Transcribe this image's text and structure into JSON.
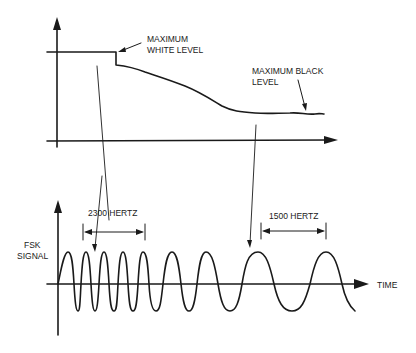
{
  "top_plot": {
    "label_white": [
      "MAXIMUM",
      "WHITE LEVEL"
    ],
    "label_black": [
      "MAXIMUM BLACK",
      "LEVEL"
    ]
  },
  "bottom_plot": {
    "y_label": [
      "FSK",
      "SIGNAL"
    ],
    "x_label": "TIME",
    "freq_high": "2300 HERTZ",
    "freq_low": "1500 HERTZ"
  },
  "colors": {
    "ink": "#1a1a1a",
    "background": "#ffffff"
  }
}
